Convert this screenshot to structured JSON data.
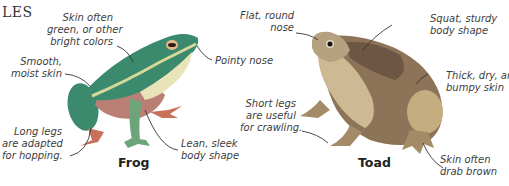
{
  "heading": "LES",
  "frog": {
    "caption": "Frog",
    "labels": {
      "skin_color": "Skin often\ngreen, or other\nbright colors",
      "smooth_skin": "Smooth,\nmoist skin",
      "pointy_nose": "Pointy nose",
      "long_legs": "Long legs\nare adapted\nfor hopping.",
      "lean_body": "Lean, sleek\nbody shape"
    },
    "colors": {
      "body": "#3b8a6e",
      "belly": "#e9e3b8",
      "feet": "#c9705a",
      "stripe": "#d8d79a"
    }
  },
  "toad": {
    "caption": "Toad",
    "labels": {
      "flat_nose": "Flat, round\nnose",
      "squat_body": "Squat, sturdy\nbody shape",
      "thick_skin": "Thick, dry, and\nbumpy skin",
      "short_legs": "Short legs\nare useful\nfor crawling.",
      "drab_skin": "Skin often\ndrab brown"
    },
    "colors": {
      "body": "#8d7358",
      "belly": "#cdb993",
      "dark": "#6e5644"
    }
  }
}
